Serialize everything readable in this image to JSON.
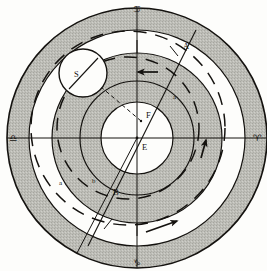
{
  "figure": {
    "kind": "astronomical-orbit-diagram",
    "width": 267,
    "height": 271,
    "background_color": "#fdfdfb",
    "ink_color": "#14120f",
    "shade_color": "#b9b9b3",
    "center": {
      "x": 137,
      "y": 138,
      "label": "E"
    },
    "radii": {
      "outer_rim": 130,
      "outer_band_inner": 108,
      "white_band_inner": 85,
      "mid_band_inner": 57,
      "inner_circle": 36
    }
  },
  "zodiac_marks": [
    {
      "name": "cancer-glyph",
      "symbol": "♋",
      "position": "top",
      "x": 137,
      "y": 12
    },
    {
      "name": "aries-glyph",
      "symbol": "♈",
      "position": "right",
      "x": 257,
      "y": 140
    },
    {
      "name": "capricorn-glyph",
      "symbol": "♑",
      "position": "bottom",
      "x": 137,
      "y": 264
    },
    {
      "name": "libra-glyph",
      "symbol": "♎",
      "position": "left",
      "x": 13,
      "y": 140
    }
  ],
  "point_labels": [
    {
      "name": "label-E",
      "text": "E",
      "x": 142,
      "y": 150,
      "style": "cap"
    },
    {
      "name": "label-F",
      "text": "F",
      "x": 146,
      "y": 118,
      "style": "cap"
    },
    {
      "name": "label-S",
      "text": "S",
      "x": 77,
      "y": 76,
      "style": "cap"
    },
    {
      "name": "label-A",
      "text": "A",
      "x": 183,
      "y": 48,
      "style": "cap"
    },
    {
      "name": "label-B",
      "text": "B",
      "x": 114,
      "y": 193,
      "style": "cap"
    },
    {
      "name": "label-a-upper",
      "text": "a",
      "x": 173,
      "y": 99,
      "style": "low"
    },
    {
      "name": "label-a-lower",
      "text": "a",
      "x": 60,
      "y": 184,
      "style": "low"
    },
    {
      "name": "label-b",
      "text": "b",
      "x": 93,
      "y": 183,
      "style": "low"
    }
  ],
  "arrows": [
    {
      "name": "arrow-upper-retrograde",
      "direction": "left",
      "x": 145,
      "y": 72
    },
    {
      "name": "arrow-right-direct",
      "direction": "up",
      "x": 204,
      "y": 146
    },
    {
      "name": "arrow-outer-direct",
      "direction": "right",
      "x": 162,
      "y": 225
    }
  ],
  "epicycle": {
    "name": "epicycle-circle",
    "center_x": 83,
    "center_y": 73,
    "radius": 24,
    "label": "S"
  },
  "legend_notes": {
    "outer_band": "shaded outer sphere",
    "white_band": "eccentric deferent zone",
    "mid_band": "shaded inner sphere",
    "inner_circle": "central white region"
  }
}
